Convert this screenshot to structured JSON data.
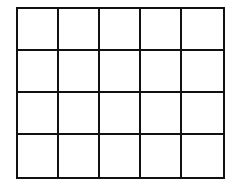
{
  "diagram": {
    "type": "grid",
    "rows": 4,
    "columns": 5,
    "cell_count": 20,
    "line_color": "#111111",
    "fill_color": "#ffffff",
    "cells": [
      [
        "",
        "",
        "",
        "",
        ""
      ],
      [
        "",
        "",
        "",
        "",
        ""
      ],
      [
        "",
        "",
        "",
        "",
        ""
      ],
      [
        "",
        "",
        "",
        "",
        ""
      ]
    ]
  }
}
